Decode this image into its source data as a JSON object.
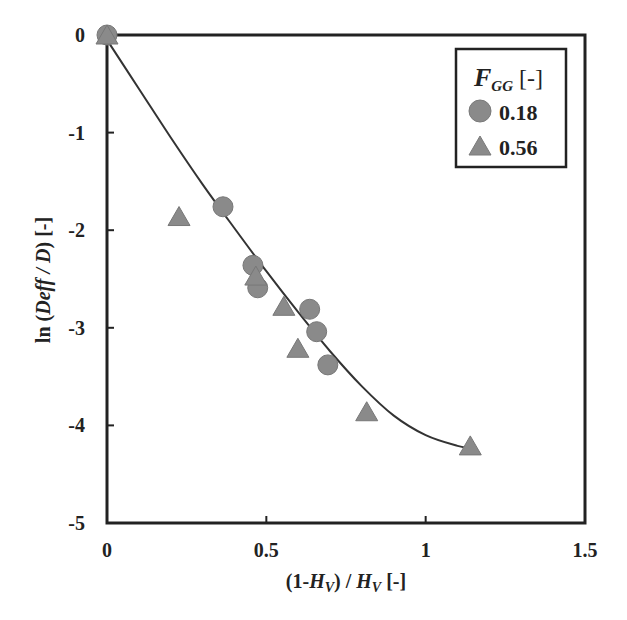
{
  "chart_data": {
    "type": "scatter",
    "title": "",
    "xlabel": "(1-H_V) / H_V [-]",
    "ylabel": "ln (Deff / D) [-]",
    "xlim": [
      0,
      1.5
    ],
    "ylim": [
      -5,
      0
    ],
    "x_ticks": [
      "0",
      "0.5",
      "1",
      "1.5"
    ],
    "y_ticks": [
      "0",
      "-1",
      "-2",
      "-3",
      "-4",
      "-5"
    ],
    "grid": false,
    "legend_position": "upper right",
    "legend_title": "F_GG [-]",
    "series": [
      {
        "name": "0.18",
        "marker": "circle",
        "color": "#8a8a8a",
        "points": [
          [
            0.0,
            0.0
          ],
          [
            0.364,
            -1.76
          ],
          [
            0.458,
            -2.36
          ],
          [
            0.473,
            -2.59
          ],
          [
            0.636,
            -2.81
          ],
          [
            0.658,
            -3.04
          ],
          [
            0.693,
            -3.38
          ]
        ]
      },
      {
        "name": "0.56",
        "marker": "triangle",
        "color": "#8a8a8a",
        "points": [
          [
            0.0,
            0.0
          ],
          [
            0.226,
            -1.86
          ],
          [
            0.467,
            -2.47
          ],
          [
            0.555,
            -2.78
          ],
          [
            0.599,
            -3.21
          ],
          [
            0.815,
            -3.86
          ],
          [
            1.14,
            -4.21
          ]
        ]
      }
    ],
    "fit_curve": {
      "name": "fit",
      "color": "#333333",
      "points": [
        [
          0.0,
          -0.05
        ],
        [
          0.1,
          -0.55
        ],
        [
          0.2,
          -1.05
        ],
        [
          0.3,
          -1.53
        ],
        [
          0.4,
          -1.98
        ],
        [
          0.5,
          -2.42
        ],
        [
          0.6,
          -2.84
        ],
        [
          0.7,
          -3.24
        ],
        [
          0.8,
          -3.6
        ],
        [
          0.9,
          -3.9
        ],
        [
          1.0,
          -4.1
        ],
        [
          1.1,
          -4.21
        ],
        [
          1.14,
          -4.23
        ]
      ]
    }
  },
  "labels": {
    "x_title_prefix": "(1-",
    "x_title_H": "H",
    "x_title_sub": "V",
    "x_title_mid": ") / ",
    "x_title_H2": "H",
    "x_title_sub2": "V",
    "x_title_suffix": " [-]",
    "y_title_prefix": "ln (",
    "y_title_italic": "Deff / D",
    "y_title_suffix": ") [-]",
    "legend_F": "F",
    "legend_sub": "GG",
    "legend_unit": " [-]",
    "legend_item1": "0.18",
    "legend_item2": "0.56"
  }
}
